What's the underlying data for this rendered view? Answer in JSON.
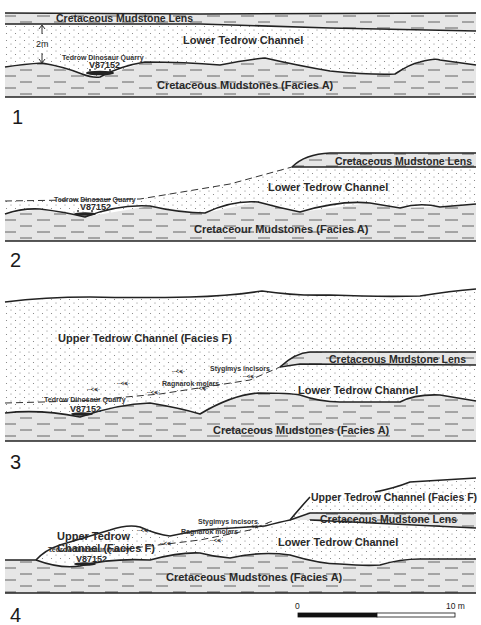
{
  "figure": {
    "panels": [
      {
        "number": "1",
        "labels": {
          "lens": "Cretaceous Mudstone Lens",
          "lower_channel": "Lower Tedrow Channel",
          "scale_2m": "2m",
          "quarry": "Tedrow Dinosaur Quarry",
          "locality": "V87152",
          "mudstones": "Cretaceous Mudstones (Facies A)"
        }
      },
      {
        "number": "2",
        "labels": {
          "lens": "Cretaceous Mudstone Lens",
          "lower_channel": "Lower Tedrow Channel",
          "quarry": "Tedrow Dinosaur Quarry",
          "locality": "V87152",
          "mudstones": "Cretaceour Mudstones (Facies A)"
        }
      },
      {
        "number": "3",
        "labels": {
          "upper_channel": "Upper Tedrow Channel (Facies F)",
          "lens": "Cretaceous Mudstone Lens",
          "stygimys": "Stygimys incisors",
          "ragnarok": "Ragnarok molars",
          "lower_channel": "Lower Tedrow Channel",
          "quarry": "Tedrow Dinosaur Quarry",
          "locality": "V87152",
          "mudstones": "Cretaceous Mudstones (Facies A)"
        }
      },
      {
        "number": "4",
        "labels": {
          "upper_channel_left_1": "Upper Tedrow",
          "upper_channel_left_2": "Channel (Facies F)",
          "upper_channel_right": "Upper Tedrow Channel (Facies F)",
          "lens": "Cretaceous Mudstone Lens",
          "stygimys": "Stygimys incisors",
          "ragnarok": "Ragnarok molars",
          "lower_channel": "Lower Tedrow Channel",
          "quarry": "Tedrow Dinosaur Quarry",
          "locality": "V87152",
          "mudstones": "Cretaceous Mudstones (Facies A)"
        }
      }
    ],
    "scale_bar": {
      "start_label": "0",
      "end_label": "10 m"
    },
    "colors": {
      "mudstone_fill": "#e6e6e6",
      "sand_fill": "#ffffff",
      "line": "#222222"
    }
  }
}
